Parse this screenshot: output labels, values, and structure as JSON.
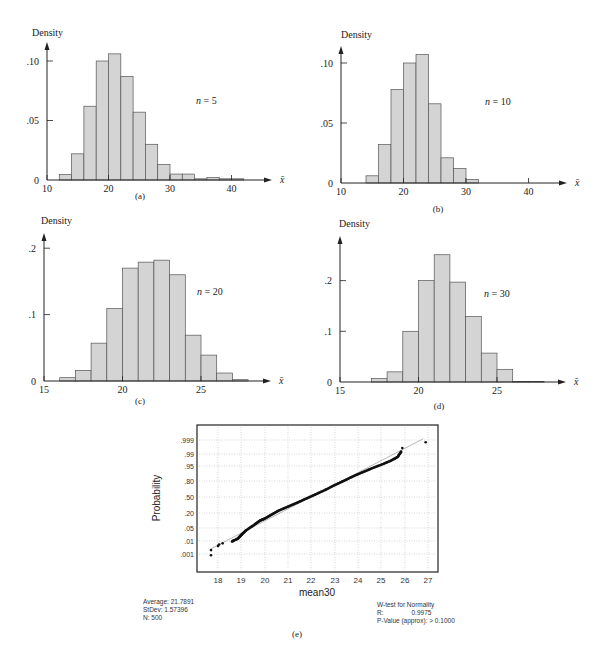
{
  "chart_data": [
    {
      "id": "a",
      "type": "bar",
      "panel_label": "(a)",
      "ylabel": "Density",
      "xlabel": "x̄",
      "annotation": "n = 5",
      "bin_width": 2,
      "bin_starts": [
        12,
        14,
        16,
        18,
        20,
        22,
        24,
        26,
        28,
        30,
        32,
        34,
        36,
        38,
        40
      ],
      "values": [
        0.0045,
        0.022,
        0.062,
        0.1,
        0.106,
        0.087,
        0.057,
        0.03,
        0.013,
        0.005,
        0.005,
        0.001,
        0.002,
        0.001,
        0.001
      ],
      "xticks": [
        10,
        20,
        30,
        40
      ],
      "yticks": [
        0,
        0.05,
        0.1
      ],
      "ytick_labels": [
        "0",
        ".05",
        ".10"
      ],
      "xlim": [
        10,
        44
      ],
      "ylim": [
        0,
        0.12
      ],
      "grid": false
    },
    {
      "id": "b",
      "type": "bar",
      "panel_label": "(b)",
      "ylabel": "Density",
      "xlabel": "x̄",
      "annotation": "n = 10",
      "bin_width": 2,
      "bin_starts": [
        14,
        16,
        18,
        20,
        22,
        24,
        26,
        28,
        30
      ],
      "values": [
        0.006,
        0.032,
        0.078,
        0.1,
        0.107,
        0.066,
        0.021,
        0.012,
        0.003
      ],
      "xticks": [
        10,
        20,
        30,
        40
      ],
      "yticks": [
        0,
        0.05,
        0.1
      ],
      "ytick_labels": [
        "0",
        ".05",
        ".10"
      ],
      "xlim": [
        10,
        44
      ],
      "ylim": [
        0,
        0.12
      ],
      "grid": false
    },
    {
      "id": "c",
      "type": "bar",
      "panel_label": "(c)",
      "ylabel": "Density",
      "xlabel": "x̄",
      "annotation": "n = 20",
      "bin_width": 1,
      "bin_starts": [
        16,
        17,
        18,
        19,
        20,
        21,
        22,
        23,
        24,
        25,
        26,
        27
      ],
      "values": [
        0.005,
        0.016,
        0.057,
        0.109,
        0.17,
        0.179,
        0.182,
        0.16,
        0.069,
        0.039,
        0.012,
        0.002
      ],
      "xticks": [
        15,
        20,
        25
      ],
      "yticks": [
        0,
        0.1,
        0.2
      ],
      "ytick_labels": [
        "0",
        ".1",
        ".2"
      ],
      "xlim": [
        15,
        29
      ],
      "ylim": [
        0,
        0.22
      ],
      "grid": false
    },
    {
      "id": "d",
      "type": "bar",
      "panel_label": "(d)",
      "ylabel": "Density",
      "xlabel": "x̄",
      "annotation": "n = 30",
      "bin_width": 1,
      "bin_starts": [
        17,
        18,
        19,
        20,
        21,
        22,
        23,
        24,
        25,
        26,
        27
      ],
      "values": [
        0.007,
        0.02,
        0.1,
        0.2,
        0.251,
        0.197,
        0.129,
        0.057,
        0.025,
        0.001,
        0.001
      ],
      "xticks": [
        15,
        20,
        25
      ],
      "yticks": [
        0,
        0.1,
        0.2
      ],
      "ytick_labels": [
        "0",
        ".1",
        ".2"
      ],
      "xlim": [
        15,
        29
      ],
      "ylim": [
        0,
        0.28
      ],
      "grid": false
    },
    {
      "id": "e",
      "type": "scatter",
      "panel_label": "(e)",
      "title": "Normal probability plot",
      "xlabel": "mean30",
      "ylabel": "Probability",
      "xticks": [
        18,
        19,
        20,
        21,
        22,
        23,
        24,
        25,
        26,
        27
      ],
      "ytick_labels": [
        ".999",
        ".99",
        ".95",
        ".80",
        ".50",
        ".20",
        ".05",
        ".01",
        ".001"
      ],
      "yticks": [
        0.999,
        0.99,
        0.95,
        0.8,
        0.5,
        0.2,
        0.05,
        0.01,
        0.001
      ],
      "xlim": [
        17.3,
        27.3
      ],
      "grid": true,
      "points_description": "approximately linear band of 500 points from (17.7, .001) to (26.9, .999)",
      "sample_points": [
        [
          17.7,
          0.0008
        ],
        [
          17.7,
          0.002
        ],
        [
          18.0,
          0.004
        ],
        [
          18.05,
          0.005
        ],
        [
          18.2,
          0.006
        ],
        [
          18.6,
          0.008
        ],
        [
          18.85,
          0.012
        ],
        [
          19.0,
          0.02
        ],
        [
          19.2,
          0.035
        ],
        [
          19.5,
          0.06
        ],
        [
          19.8,
          0.1
        ],
        [
          20.0,
          0.12
        ],
        [
          20.3,
          0.17
        ],
        [
          20.6,
          0.23
        ],
        [
          21.0,
          0.3
        ],
        [
          21.4,
          0.38
        ],
        [
          21.8,
          0.47
        ],
        [
          22.2,
          0.56
        ],
        [
          22.6,
          0.65
        ],
        [
          23.0,
          0.74
        ],
        [
          23.4,
          0.81
        ],
        [
          23.8,
          0.87
        ],
        [
          24.2,
          0.91
        ],
        [
          24.6,
          0.94
        ],
        [
          25.0,
          0.96
        ],
        [
          25.4,
          0.975
        ],
        [
          25.7,
          0.985
        ],
        [
          25.85,
          0.993
        ],
        [
          25.9,
          0.996
        ],
        [
          26.9,
          0.9985
        ]
      ],
      "fit_line": [
        [
          17.7,
          0.0025
        ],
        [
          26.8,
          0.9992
        ]
      ],
      "stats_left": {
        "average": "Average: 21.7891",
        "stdev": "StDev: 1.57396",
        "n": "N: 500"
      },
      "stats_right": {
        "title": "W-test for Normality",
        "r_label": "R:",
        "r_value": "0.9975",
        "pvalue": "P-Value (approx): > 0.1000"
      }
    }
  ],
  "page": {
    "bar_fill": "#d4d4d4",
    "bar_stroke": "#555555",
    "axis_color": "#222222",
    "grid_color": "#aaaaaa",
    "point_color": "#111111"
  }
}
